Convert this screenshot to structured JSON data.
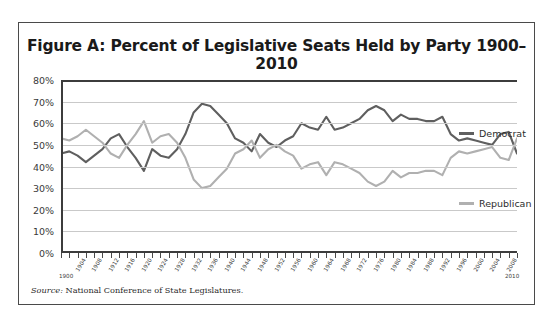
{
  "figure": {
    "title": "Figure A: Percent of Legislative Seats Held by Party 1900–2010",
    "source_label": "Source:",
    "source_text": "National Conference of State Legislatures."
  },
  "legend": {
    "democrat": "Democrat",
    "republican": "Republican"
  },
  "colors": {
    "democrat": "#5f5f5f",
    "republican": "#b0b0b0",
    "axis": "#3c3c3c",
    "grid": "#c9c9c9",
    "frame": "#4a4a4a"
  },
  "axes": {
    "y_ticks": [
      "0%",
      "10%",
      "20%",
      "30%",
      "40%",
      "50%",
      "60%",
      "70%",
      "80%"
    ],
    "x_edge_start": "1900",
    "x_edge_end": "2010",
    "x_ticks": [
      "1904",
      "1908",
      "1912",
      "1916",
      "1920",
      "1924",
      "1928",
      "1932",
      "1936",
      "1940",
      "1944",
      "1948",
      "1952",
      "1956",
      "1960",
      "1964",
      "1968",
      "1972",
      "1976",
      "1980",
      "1984",
      "1988",
      "1992",
      "1996",
      "2000",
      "2004",
      "2008"
    ]
  },
  "chart_data": {
    "type": "line",
    "title": "Figure A: Percent of Legislative Seats Held by Party 1900–2010",
    "xlabel": "",
    "ylabel": "",
    "xlim": [
      1900,
      2010
    ],
    "ylim": [
      0,
      80
    ],
    "y_tick_step": 10,
    "grid": true,
    "legend_position": "right",
    "x": [
      1900,
      1902,
      1904,
      1906,
      1908,
      1910,
      1912,
      1914,
      1916,
      1918,
      1920,
      1922,
      1924,
      1926,
      1928,
      1930,
      1932,
      1934,
      1936,
      1938,
      1940,
      1942,
      1944,
      1946,
      1948,
      1950,
      1952,
      1954,
      1956,
      1958,
      1960,
      1962,
      1964,
      1966,
      1968,
      1970,
      1972,
      1974,
      1976,
      1978,
      1980,
      1982,
      1984,
      1986,
      1988,
      1990,
      1992,
      1994,
      1996,
      1998,
      2000,
      2002,
      2004,
      2006,
      2008,
      2010
    ],
    "series": [
      {
        "name": "Democrat",
        "color": "#5f5f5f",
        "values": [
          46,
          47,
          45,
          42,
          45,
          48,
          53,
          55,
          49,
          44,
          38,
          48,
          45,
          44,
          48,
          55,
          65,
          69,
          68,
          64,
          60,
          53,
          51,
          47,
          55,
          51,
          49,
          52,
          54,
          60,
          58,
          57,
          63,
          57,
          58,
          60,
          62,
          66,
          68,
          66,
          61,
          64,
          62,
          62,
          61,
          61,
          63,
          55,
          52,
          53,
          52,
          51,
          50,
          55,
          56,
          46
        ]
      },
      {
        "name": "Republican",
        "color": "#b0b0b0",
        "values": [
          53,
          52,
          54,
          57,
          54,
          51,
          46,
          44,
          50,
          55,
          61,
          51,
          54,
          55,
          51,
          44,
          34,
          30,
          31,
          35,
          39,
          46,
          48,
          52,
          44,
          48,
          50,
          47,
          45,
          39,
          41,
          42,
          36,
          42,
          41,
          39,
          37,
          33,
          31,
          33,
          38,
          35,
          37,
          37,
          38,
          38,
          36,
          44,
          47,
          46,
          47,
          48,
          49,
          44,
          43,
          53
        ]
      }
    ]
  }
}
